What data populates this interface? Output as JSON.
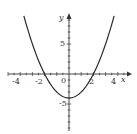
{
  "chart_data": {
    "type": "line",
    "title": "",
    "function": "y = x^2 - 4",
    "xlabel": "x",
    "ylabel": "y",
    "x_ticks_labeled": [
      -4,
      -2,
      0,
      2,
      4
    ],
    "y_ticks_labeled": [
      5,
      -5
    ],
    "xlim": [
      -4.5,
      4.5
    ],
    "ylim": [
      -9,
      9.5
    ],
    "grid": false,
    "series": [
      {
        "name": "parabola",
        "x": [
          -3.7,
          -3,
          -2,
          -1,
          0,
          1,
          2,
          3,
          3.7
        ],
        "values": [
          9.69,
          5,
          0,
          -3,
          -4,
          -3,
          0,
          5,
          9.69
        ]
      }
    ],
    "colors": {
      "curve": "#2a2a2a",
      "axes": "#333333"
    }
  },
  "labels": {
    "x_axis": "x",
    "y_axis": "y",
    "x_neg4": "-4",
    "x_neg2": "-2",
    "origin": "0",
    "x_2": "2",
    "x_4": "4",
    "y_5": "5",
    "y_neg5": "-5"
  }
}
